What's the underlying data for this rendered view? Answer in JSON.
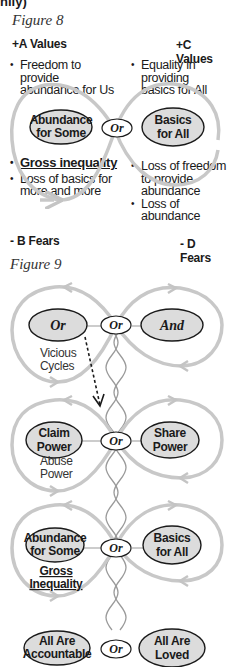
{
  "cropped_header": "nily)",
  "figure8": {
    "title": "Figure 8",
    "a_values": {
      "heading": "+A Values",
      "bullets": [
        "Freedom to provide abundance for Us"
      ],
      "lines": [
        "Freedom to",
        "provide",
        "abundance for Us"
      ]
    },
    "c_values": {
      "heading": "+C Values",
      "lines": [
        "Equality in",
        "providing",
        "basics for All"
      ]
    },
    "left_node": [
      "Abundance",
      "for Some"
    ],
    "center_node": "Or",
    "right_node": [
      "Basics",
      "for All"
    ],
    "b_fears": {
      "heading": "- B Fears",
      "bullet1": "Gross inequality",
      "bullet2_lines": [
        "Loss of basics for",
        "more and more"
      ]
    },
    "d_fears": {
      "heading": "- D Fears",
      "bullet1_lines": [
        "Loss of freedom",
        "to provide",
        "abundance"
      ],
      "bullet2_lines": [
        "Loss of",
        "abundance"
      ]
    }
  },
  "figure9": {
    "title": "Figure 9",
    "level1": {
      "left": "Or",
      "center": "Or",
      "right": "And",
      "caption": [
        "Vicious",
        "Cycles"
      ]
    },
    "level2": {
      "left": [
        "Claim",
        "Power"
      ],
      "center": "Or",
      "right": [
        "Share",
        "Power"
      ],
      "caption": [
        "Abuse",
        "Power"
      ]
    },
    "level3": {
      "left": [
        "Abundance",
        "for Some"
      ],
      "center": "Or",
      "right": [
        "Basics",
        "for All"
      ],
      "caption": [
        "Gross",
        "Inequality"
      ]
    },
    "level4": {
      "left": [
        "All Are",
        "Accountable"
      ],
      "center": "Or",
      "right": [
        "All Are",
        "Loved"
      ]
    }
  },
  "colors": {
    "loop": "#c4c4c4",
    "ellipse_fill": "#dcdcdc",
    "ellipse_stroke": "#1a1a1a",
    "text": "#1a1a1a"
  }
}
